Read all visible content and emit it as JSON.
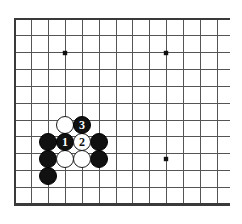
{
  "figure": {
    "board_background": "#ffffff",
    "line_color": "#555555",
    "edge_color": "#3a3a3a",
    "black_stone_color": "#111111",
    "white_stone_color": "#ffffff"
  },
  "board": {
    "geometry": {
      "origin_x": 15,
      "origin_y": 19,
      "spacing": 16.85,
      "cols": 13,
      "rows": 12,
      "stone_radius": 9.2
    },
    "star_points": [
      {
        "name": "star-point-top-left",
        "x": 65,
        "y": 53
      },
      {
        "name": "star-point-top-right",
        "x": 166,
        "y": 53
      },
      {
        "name": "star-point-bottom-right",
        "x": 166,
        "y": 159
      }
    ]
  },
  "stones": [
    {
      "name": "black-stone-a",
      "color": "black",
      "x": 48,
      "y": 142,
      "label": ""
    },
    {
      "name": "black-stone-b",
      "color": "black",
      "x": 48,
      "y": 159,
      "label": ""
    },
    {
      "name": "black-stone-c",
      "color": "black",
      "x": 48,
      "y": 176,
      "label": ""
    },
    {
      "name": "black-stone-d",
      "color": "black",
      "x": 99,
      "y": 142,
      "label": ""
    },
    {
      "name": "black-stone-e",
      "color": "black",
      "x": 99,
      "y": 159,
      "label": ""
    },
    {
      "name": "white-stone-a",
      "color": "white",
      "x": 65,
      "y": 125,
      "label": ""
    },
    {
      "name": "white-stone-b",
      "color": "white",
      "x": 65,
      "y": 159,
      "label": ""
    },
    {
      "name": "white-stone-c",
      "color": "white",
      "x": 82,
      "y": 159,
      "label": ""
    },
    {
      "name": "move-1-black",
      "color": "black",
      "x": 65,
      "y": 142,
      "label": "1"
    },
    {
      "name": "move-2-white",
      "color": "white",
      "x": 82,
      "y": 142,
      "label": "2"
    },
    {
      "name": "move-3-black",
      "color": "black",
      "x": 82,
      "y": 125,
      "label": "3"
    }
  ],
  "move_labels": {
    "move_1": "1",
    "move_2": "2",
    "move_3": "3"
  }
}
